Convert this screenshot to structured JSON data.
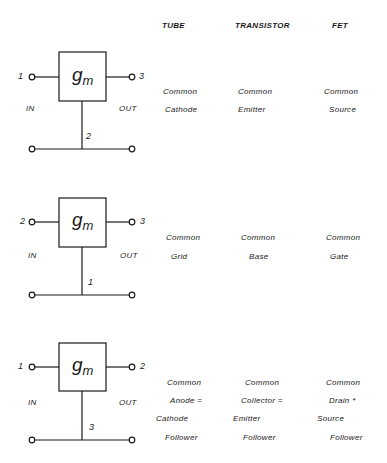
{
  "headers": {
    "tube": "TUBE",
    "transistor": "TRANSISTOR",
    "fet": "FET"
  },
  "block_symbol": {
    "main": "g",
    "sub": "m"
  },
  "configurations": [
    {
      "terminals": {
        "in": "1",
        "out": "3",
        "common": "2"
      },
      "io": {
        "in": "IN",
        "out": "OUT"
      },
      "tube": [
        "Common",
        "Cathode"
      ],
      "transistor": [
        "Common",
        "Emitter"
      ],
      "fet": [
        "Common",
        "Source"
      ]
    },
    {
      "terminals": {
        "in": "2",
        "out": "3",
        "common": "1"
      },
      "io": {
        "in": "IN",
        "out": "OUT"
      },
      "tube": [
        "Common",
        "Grid"
      ],
      "transistor": [
        "Common",
        "Base"
      ],
      "fet": [
        "Common",
        "Gate"
      ]
    },
    {
      "terminals": {
        "in": "1",
        "out": "2",
        "common": "3"
      },
      "io": {
        "in": "IN",
        "out": "OUT"
      },
      "tube": [
        "Common",
        "Anode =",
        "Cathode",
        "Follower"
      ],
      "transistor": [
        "Common",
        "Collector =",
        "Emitter",
        "Follower"
      ],
      "fet": [
        "Common",
        "Drain *",
        "Source",
        "Follower"
      ]
    }
  ]
}
